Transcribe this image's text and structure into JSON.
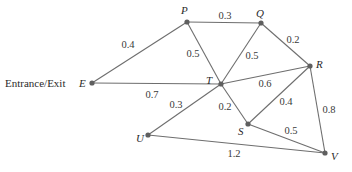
{
  "diagram": {
    "type": "weighted-graph",
    "entrance_label": "Entrance/Exit",
    "nodes": [
      {
        "id": "E",
        "label": "E",
        "x": 92,
        "y": 83
      },
      {
        "id": "P",
        "label": "P",
        "x": 187,
        "y": 22
      },
      {
        "id": "Q",
        "label": "Q",
        "x": 261,
        "y": 23
      },
      {
        "id": "R",
        "label": "R",
        "x": 310,
        "y": 66
      },
      {
        "id": "T",
        "label": "T",
        "x": 221,
        "y": 84
      },
      {
        "id": "S",
        "label": "S",
        "x": 248,
        "y": 124
      },
      {
        "id": "U",
        "label": "U",
        "x": 148,
        "y": 135
      },
      {
        "id": "V",
        "label": "V",
        "x": 325,
        "y": 153
      }
    ],
    "edges": [
      {
        "from": "E",
        "to": "P",
        "weight": "0.4"
      },
      {
        "from": "E",
        "to": "T",
        "weight": "0.7"
      },
      {
        "from": "P",
        "to": "Q",
        "weight": "0.3"
      },
      {
        "from": "P",
        "to": "T",
        "weight": "0.5"
      },
      {
        "from": "Q",
        "to": "T",
        "weight": "0.5"
      },
      {
        "from": "Q",
        "to": "R",
        "weight": "0.2"
      },
      {
        "from": "T",
        "to": "R",
        "weight": "0.6"
      },
      {
        "from": "T",
        "to": "U",
        "weight": "0.3"
      },
      {
        "from": "T",
        "to": "S",
        "weight": "0.2"
      },
      {
        "from": "R",
        "to": "S",
        "weight": "0.4"
      },
      {
        "from": "R",
        "to": "V",
        "weight": "0.8"
      },
      {
        "from": "S",
        "to": "V",
        "weight": "0.5"
      },
      {
        "from": "U",
        "to": "V",
        "weight": "1.2"
      }
    ]
  }
}
